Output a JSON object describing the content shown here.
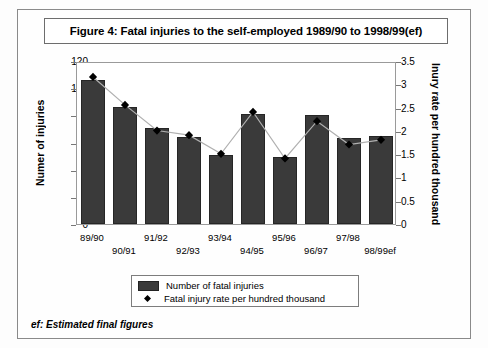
{
  "figure": {
    "title": "Figure 4: Fatal injuries to the self-employed 1989/90 to 1998/99(ef)",
    "footnote": "ef:  Estimated final figures"
  },
  "legend": {
    "bars_label": "Number of fatal injuries",
    "line_label": "Fatal injury rate per hundred thousand"
  },
  "colors": {
    "bar_fill": "#3a3a3a",
    "bar_edge": "#262626",
    "marker": "#000000",
    "line": "#b0b0b0",
    "frame": "#8a8a8a"
  },
  "chart_data": {
    "type": "bar",
    "title": "Figure 4: Fatal injuries to the self-employed 1989/90 to 1998/99(ef)",
    "xlabel": "",
    "ylabel": "Numer of injuries",
    "y2label": "Inury rate per hundred thousand",
    "categories": [
      "89/90",
      "90/91",
      "91/92",
      "92/93",
      "93/94",
      "94/95",
      "95/96",
      "96/97",
      "97/98",
      "98/99ef"
    ],
    "ylim": [
      0,
      120
    ],
    "yticks": [
      0,
      20,
      40,
      60,
      80,
      100,
      120
    ],
    "y2lim": [
      0,
      3.5
    ],
    "y2ticks": [
      "0",
      "0.5",
      "1",
      "1.5",
      "2",
      "2.5",
      "3",
      "3.5"
    ],
    "grid": false,
    "legend_position": "bottom-center",
    "series": [
      {
        "name": "Number of fatal injuries",
        "type": "bar",
        "axis": "left",
        "values": [
          106,
          86,
          71,
          64,
          51,
          81,
          49,
          80,
          63,
          65
        ]
      },
      {
        "name": "Fatal injury rate per hundred thousand",
        "type": "line",
        "axis": "right",
        "values": [
          3.2,
          2.6,
          2.05,
          1.95,
          1.55,
          2.45,
          1.45,
          2.25,
          1.75,
          1.85
        ]
      }
    ]
  }
}
